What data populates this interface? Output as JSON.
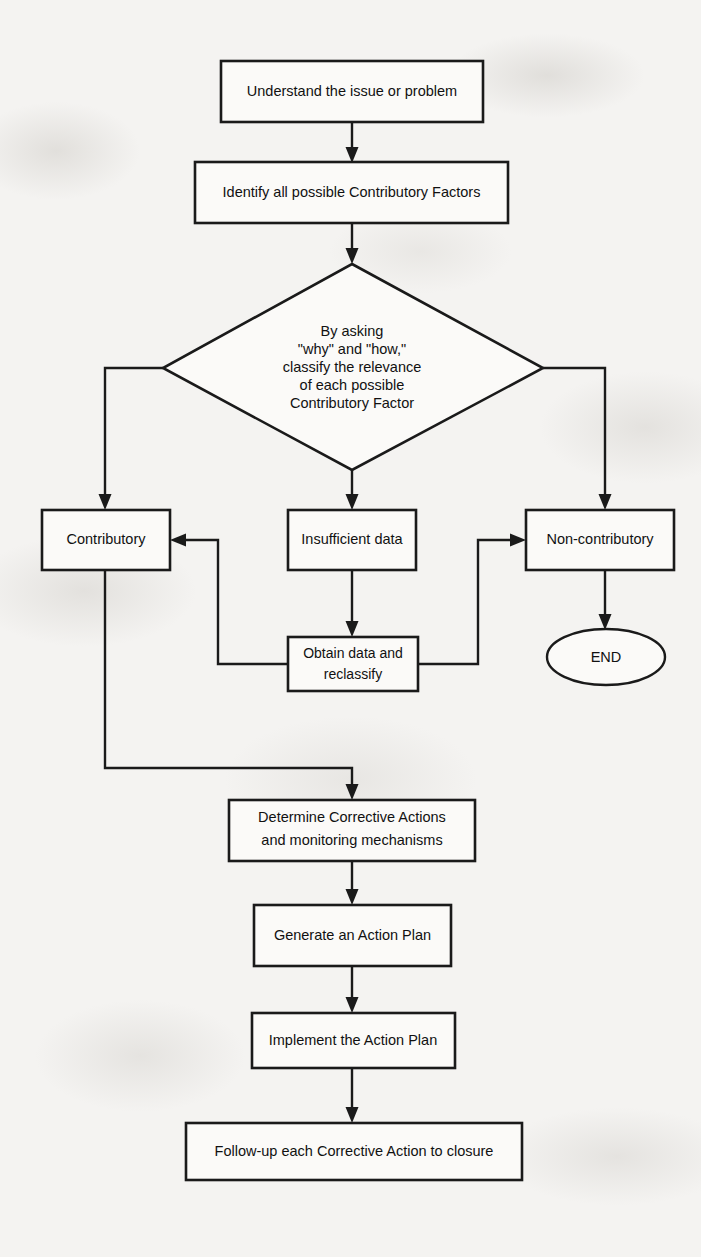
{
  "diagram": {
    "type": "flowchart",
    "background_color": "#f4f3f1",
    "line_color": "#1a1a1a",
    "node_fill": "#fbfaf8",
    "nodes": [
      {
        "id": "understand",
        "shape": "process",
        "text": "Understand the issue or problem"
      },
      {
        "id": "identify",
        "shape": "process",
        "text": "Identify all possible Contributory Factors"
      },
      {
        "id": "classify",
        "shape": "decision",
        "lines": [
          "By asking",
          "\"why\" and \"how,\"",
          "classify the relevance",
          "of each possible",
          "Contributory Factor"
        ]
      },
      {
        "id": "contributory",
        "shape": "process",
        "text": "Contributory"
      },
      {
        "id": "insufficient",
        "shape": "process",
        "text": "Insufficient data"
      },
      {
        "id": "noncontributory",
        "shape": "process",
        "text": "Non-contributory"
      },
      {
        "id": "obtain",
        "shape": "process",
        "lines": [
          "Obtain data and",
          "reclassify"
        ]
      },
      {
        "id": "end",
        "shape": "terminator",
        "text": "END"
      },
      {
        "id": "determine",
        "shape": "process",
        "lines": [
          "Determine Corrective Actions",
          "and monitoring mechanisms"
        ]
      },
      {
        "id": "generate",
        "shape": "process",
        "text": "Generate an Action Plan"
      },
      {
        "id": "implement",
        "shape": "process",
        "text": "Implement the Action Plan"
      },
      {
        "id": "followup",
        "shape": "process",
        "text": "Follow-up each Corrective Action to closure"
      }
    ],
    "edges": [
      {
        "from": "understand",
        "to": "identify",
        "label": ""
      },
      {
        "from": "identify",
        "to": "classify",
        "label": ""
      },
      {
        "from": "classify",
        "to": "contributory",
        "label": ""
      },
      {
        "from": "classify",
        "to": "insufficient",
        "label": ""
      },
      {
        "from": "classify",
        "to": "noncontributory",
        "label": ""
      },
      {
        "from": "insufficient",
        "to": "obtain",
        "label": ""
      },
      {
        "from": "obtain",
        "to": "contributory",
        "label": ""
      },
      {
        "from": "obtain",
        "to": "noncontributory",
        "label": ""
      },
      {
        "from": "noncontributory",
        "to": "end",
        "label": ""
      },
      {
        "from": "contributory",
        "to": "determine",
        "label": ""
      },
      {
        "from": "determine",
        "to": "generate",
        "label": ""
      },
      {
        "from": "generate",
        "to": "implement",
        "label": ""
      },
      {
        "from": "implement",
        "to": "followup",
        "label": ""
      }
    ]
  }
}
